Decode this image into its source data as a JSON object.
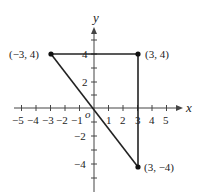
{
  "axes": {
    "x_label": "x",
    "y_label": "y",
    "origin_label": "o",
    "x_ticks": [
      "−5",
      "−4",
      "−3",
      "−2",
      "−1",
      "1",
      "2",
      "3",
      "4",
      "5"
    ],
    "y_ticks": [
      "4",
      "2",
      "−2",
      "−4"
    ]
  },
  "points": [
    {
      "label": "(−3, 4)",
      "x": -3,
      "y": 4
    },
    {
      "label": "(3, 4)",
      "x": 3,
      "y": 4
    },
    {
      "label": "(3, −4)",
      "x": 3,
      "y": -4
    }
  ],
  "segments": [
    {
      "from": "(−3, 4)",
      "to": "(3, 4)"
    },
    {
      "from": "(3, 4)",
      "to": "(3, −4)"
    },
    {
      "from": "(−3, 4)",
      "to": "(3, −4)"
    }
  ],
  "colors": {
    "ink": "#222222",
    "background": "#ffffff"
  }
}
